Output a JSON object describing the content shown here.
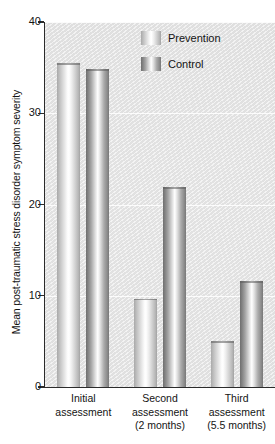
{
  "chart_data": {
    "type": "bar",
    "title": "",
    "subtitle": "",
    "xlabel": "",
    "ylabel": "Mean post-traumatic stress disorder symptom severity",
    "ylim": [
      0,
      40
    ],
    "yticks": [
      0,
      10,
      20,
      30,
      40
    ],
    "ytick_labels": [
      "0",
      "10",
      "20",
      "30",
      "40"
    ],
    "grid": true,
    "grid_axis": "y",
    "legend_position": "top-right",
    "categories": [
      "Initial assessment",
      "Second assessment (2 months)",
      "Third assessment (5.5 months)"
    ],
    "category_lines": [
      [
        "Initial",
        "assessment"
      ],
      [
        "Second",
        "assessment",
        "(2 months)"
      ],
      [
        "Third",
        "assessment",
        "(5.5 months)"
      ]
    ],
    "series": [
      {
        "name": "Prevention",
        "color": "#d8d8d8",
        "values": [
          35.5,
          9.7,
          5.0
        ]
      },
      {
        "name": "Control",
        "color": "#8c8c8c",
        "values": [
          34.8,
          21.9,
          11.6
        ]
      }
    ]
  },
  "legend": {
    "items": [
      {
        "label": "Prevention"
      },
      {
        "label": "Control"
      }
    ]
  },
  "axes": {
    "y_title": "Mean post-traumatic stress disorder symptom severity"
  },
  "colors": {
    "plot_background": "#e4e4e4",
    "axis": "#2b2b2b",
    "gridline": "#ffffff",
    "text": "#141414",
    "prevention_bar": "#d8d8d8",
    "control_bar": "#8c8c8c"
  }
}
